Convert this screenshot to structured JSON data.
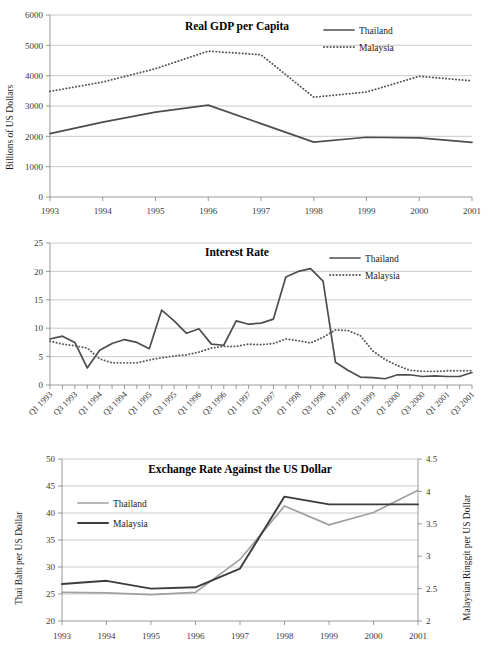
{
  "chart_data": [
    {
      "id": "gdp",
      "type": "line",
      "title": "Real GDP per Capita",
      "xlabel": "",
      "ylabel": "Billions of US Dollars",
      "ylim": [
        0,
        6000
      ],
      "ytick_step": 1000,
      "yticks": [
        "0",
        "1000",
        "2000",
        "3000",
        "4000",
        "5000",
        "6000"
      ],
      "grid": true,
      "legend_position": "top-right",
      "categories": [
        "1993",
        "1994",
        "1995",
        "1996",
        "1997",
        "1998",
        "1999",
        "2000",
        "2001"
      ],
      "x": [
        1993,
        1994,
        1995,
        1996,
        1997,
        1998,
        1999,
        2000,
        2001
      ],
      "series": [
        {
          "name": "Thailand",
          "style": "solid",
          "color": "#4d4d4d",
          "values": [
            2090,
            2470,
            2800,
            3030,
            2420,
            1810,
            1970,
            1950,
            1800
          ]
        },
        {
          "name": "Malaysia",
          "style": "dotted",
          "color": "#595959",
          "values": [
            3480,
            3790,
            4230,
            4810,
            4690,
            3290,
            3460,
            3980,
            3830
          ]
        }
      ]
    },
    {
      "id": "interest",
      "type": "line",
      "title": "Interest Rate",
      "xlabel": "",
      "ylabel": "",
      "ylim": [
        0,
        25
      ],
      "ytick_step": 5,
      "yticks": [
        "0",
        "5",
        "10",
        "15",
        "20",
        "25"
      ],
      "grid": true,
      "legend_position": "top-right",
      "categories": [
        "Q1 1993",
        "Q2 1993",
        "Q3 1993",
        "Q4 1993",
        "Q1 1994",
        "Q2 1994",
        "Q3 1994",
        "Q4 1994",
        "Q1 1995",
        "Q2 1995",
        "Q3 1995",
        "Q4 1995",
        "Q1 1996",
        "Q2 1996",
        "Q3 1996",
        "Q4 1996",
        "Q1 1997",
        "Q2 1997",
        "Q3 1997",
        "Q4 1997",
        "Q1 1998",
        "Q2 1998",
        "Q3 1998",
        "Q4 1998",
        "Q1 1999",
        "Q2 1999",
        "Q3 1999",
        "Q4 1999",
        "Q1 2000",
        "Q2 2000",
        "Q3 2000",
        "Q4 2000",
        "Q1 2001",
        "Q2 2001",
        "Q3 2001"
      ],
      "xtick_labels_shown": [
        "Q1 1993",
        "Q3 1993",
        "Q1 1994",
        "Q3 1994",
        "Q1 1995",
        "Q3 1995",
        "Q1 1996",
        "Q3 1996",
        "Q1 1997",
        "Q3 1997",
        "Q1 1998",
        "Q3 1998",
        "Q1 1999",
        "Q3 1999",
        "Q1 2000",
        "Q3 2000",
        "Q1 2001",
        "Q3 2001"
      ],
      "series": [
        {
          "name": "Thailand",
          "style": "solid",
          "color": "#4d4d4d",
          "values": [
            8.1,
            8.6,
            7.5,
            3.0,
            6.1,
            7.3,
            8.0,
            7.5,
            6.4,
            13.2,
            11.3,
            9.1,
            9.9,
            7.2,
            7.0,
            11.3,
            10.7,
            10.9,
            11.6,
            19.0,
            20.0,
            20.5,
            18.3,
            4.0,
            2.6,
            1.4,
            1.3,
            1.1,
            1.8,
            1.8,
            1.5,
            1.6,
            1.5,
            1.5,
            2.2
          ]
        },
        {
          "name": "Malaysia",
          "style": "dotted",
          "color": "#595959",
          "values": [
            7.7,
            7.2,
            6.9,
            6.5,
            4.6,
            3.9,
            3.9,
            3.9,
            4.4,
            4.8,
            5.1,
            5.3,
            5.8,
            6.5,
            6.8,
            6.8,
            7.2,
            7.1,
            7.3,
            8.1,
            7.8,
            7.4,
            8.4,
            9.7,
            9.6,
            8.7,
            6.0,
            4.5,
            3.4,
            2.6,
            2.4,
            2.4,
            2.5,
            2.5,
            2.5
          ]
        }
      ]
    },
    {
      "id": "fx",
      "type": "line",
      "title": "Exchange Rate Against the US Dollar",
      "xlabel": "",
      "ylabel": "Thai Baht per US Dollar",
      "y2label": "Malaysian Ringgit per US Dollar",
      "ylim": [
        20,
        50
      ],
      "ytick_step": 5,
      "yticks": [
        "20",
        "25",
        "30",
        "35",
        "40",
        "45",
        "50"
      ],
      "y2lim": [
        2,
        4.5
      ],
      "y2ticks": [
        "2",
        "2.5",
        "3",
        "3.5",
        "4",
        "4.5"
      ],
      "grid": true,
      "legend_position": "top-left",
      "categories": [
        "1993",
        "1994",
        "1995",
        "1996",
        "1997",
        "1998",
        "1999",
        "2000",
        "2001"
      ],
      "x": [
        1993,
        1994,
        1995,
        1996,
        1997,
        1998,
        1999,
        2000,
        2001
      ],
      "series": [
        {
          "name": "Thailand",
          "style": "solid",
          "color": "#a0a0a0",
          "axis": "left",
          "unit": "Thai Baht per US Dollar",
          "values": [
            25.3,
            25.2,
            24.9,
            25.3,
            31.4,
            41.3,
            37.8,
            40.1,
            44.2
          ]
        },
        {
          "name": "Malaysia",
          "style": "solid",
          "color": "#3c3c3c",
          "axis": "right",
          "unit": "Malaysian Ringgit per US Dollar",
          "values": [
            2.57,
            2.62,
            2.5,
            2.52,
            2.81,
            3.92,
            3.8,
            3.8,
            3.8
          ]
        }
      ]
    }
  ]
}
